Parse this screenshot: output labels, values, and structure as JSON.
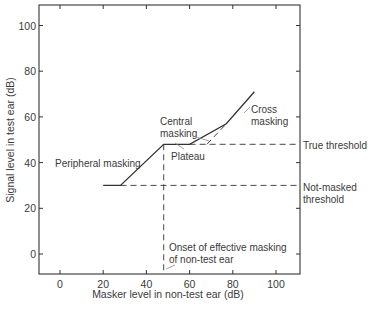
{
  "chart_data": {
    "type": "line",
    "title": "",
    "xlabel": "Masker level in non-test ear (dB)",
    "ylabel": "Signal level in test ear (dB)",
    "xlim": [
      -10,
      110
    ],
    "ylim": [
      -10,
      110
    ],
    "x_ticks": [
      0,
      20,
      40,
      60,
      80,
      100
    ],
    "y_ticks": [
      0,
      20,
      40,
      60,
      80,
      100
    ],
    "grid": false,
    "series": [
      {
        "name": "Masking function",
        "style": "solid",
        "points": [
          [
            20,
            30
          ],
          [
            28,
            30
          ],
          [
            48,
            48
          ],
          [
            60,
            48
          ],
          [
            77,
            57
          ],
          [
            90,
            71
          ]
        ]
      },
      {
        "name": "True threshold",
        "style": "dashed",
        "points": [
          [
            60,
            48
          ],
          [
            110,
            48
          ]
        ]
      },
      {
        "name": "Not-masked threshold",
        "style": "dashed",
        "points": [
          [
            28,
            30
          ],
          [
            110,
            30
          ]
        ]
      },
      {
        "name": "Onset of effective masking",
        "style": "dashed",
        "points": [
          [
            48,
            48
          ],
          [
            48,
            -10
          ]
        ]
      },
      {
        "name": "Cross masking extrapolation",
        "style": "dashed",
        "points": [
          [
            68,
            48
          ],
          [
            77,
            57
          ]
        ]
      }
    ],
    "annotations": {
      "peripheral": "Peripheral masking",
      "central_1": "Central",
      "central_2": "masking",
      "plateau": "Plateau",
      "cross_1": "Cross",
      "cross_2": "masking",
      "true_threshold": "True threshold",
      "not_masked_1": "Not-masked",
      "not_masked_2": "threshold",
      "onset_1": "Onset of effective masking",
      "onset_2": "of non-test ear"
    }
  }
}
